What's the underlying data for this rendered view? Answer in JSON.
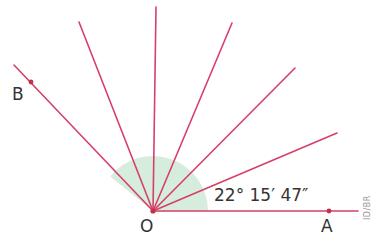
{
  "diagram": {
    "type": "angle-rays",
    "vertex": {
      "label": "O",
      "x": 153,
      "y": 211
    },
    "points": [
      {
        "label": "A",
        "x": 329,
        "y": 211
      },
      {
        "label": "B",
        "x": 31,
        "y": 82
      }
    ],
    "angle_label": "22° 15′ 47″",
    "credit": "ID/BR",
    "colors": {
      "rays": "#d64068",
      "arc_fill": "#cfe9d6",
      "text": "#333333"
    },
    "ray_endpoints": [
      [
        358,
        211
      ],
      [
        337,
        133
      ],
      [
        295,
        68
      ],
      [
        232,
        23
      ],
      [
        156,
        7
      ],
      [
        79,
        22
      ],
      [
        14,
        65
      ]
    ]
  }
}
